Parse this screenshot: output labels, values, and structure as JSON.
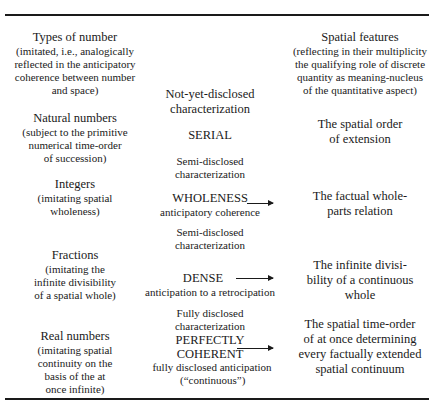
{
  "left_column": {
    "header": {
      "title": "Types of number",
      "lines": [
        "(imitated, i.e., analogically",
        "reflected in the anticipatory",
        "coherence between number",
        "and space)"
      ]
    },
    "rows": [
      {
        "title": "Natural numbers",
        "lines": [
          "(subject to the primitive",
          "numerical time-order",
          "of succession)"
        ]
      },
      {
        "title": "Integers",
        "lines": [
          "(imitating spatial",
          "wholeness)"
        ]
      },
      {
        "title": "Fractions",
        "lines": [
          "(imitating the",
          "infinite divisibility",
          "of a spatial whole)"
        ]
      },
      {
        "title": "Real numbers",
        "lines": [
          "(imitating spatial",
          "continuity on the",
          "basis of the at",
          "once infinite)"
        ]
      }
    ]
  },
  "middle_column": {
    "items": [
      {
        "caption": [
          "Not-yet-disclosed",
          "characterization"
        ],
        "term": "SERIAL",
        "sub": ""
      },
      {
        "caption": [
          "Semi-disclosed",
          "characterization"
        ],
        "term": "WHOLENESS",
        "sub": "anticipatory coherence"
      },
      {
        "caption": [
          "Semi-disclosed",
          "characterization"
        ],
        "term": "DENSE",
        "sub": "anticipation to a retrocipation"
      },
      {
        "caption": [
          "Fully disclosed",
          "characterization"
        ],
        "term_lines": [
          "PERFECTLY",
          "COHERENT"
        ],
        "sub_lines": [
          "fully disclosed anticipation",
          "(“continuous”)"
        ]
      }
    ]
  },
  "right_column": {
    "header": {
      "title": "Spatial features",
      "lines": [
        "(reflecting in their multiplicity",
        "the qualifying role of discrete",
        "quantity as meaning-nucleus",
        "of the quantitative aspect)"
      ]
    },
    "rows": [
      {
        "lines": [
          "The spatial order",
          "of extension"
        ]
      },
      {
        "lines": [
          "The factual whole-",
          "parts relation"
        ]
      },
      {
        "lines": [
          "The infinite divisi-",
          "bility of a continuous",
          "whole"
        ]
      },
      {
        "lines": [
          "The spatial time-order",
          "of at once determining",
          "every factually extended",
          "spatial continuum"
        ]
      }
    ]
  }
}
